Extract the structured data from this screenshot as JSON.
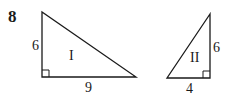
{
  "question": {
    "number": "8"
  },
  "triangles": [
    {
      "id": "I",
      "label": "I",
      "leg_vertical": "6",
      "leg_horizontal": "9",
      "right_angle": "bottom-left"
    },
    {
      "id": "II",
      "label": "II",
      "leg_vertical": "6",
      "leg_horizontal": "4",
      "right_angle": "bottom-right"
    }
  ],
  "colors": {
    "stroke": "#1a1a1a",
    "background": "#ffffff"
  }
}
